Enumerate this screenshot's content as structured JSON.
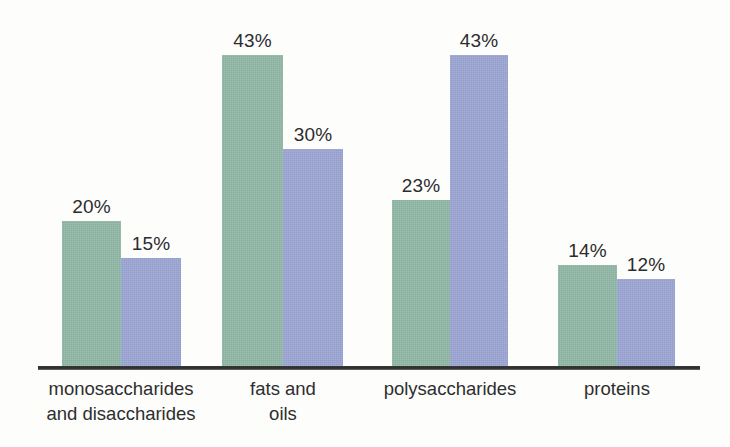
{
  "chart_data": {
    "type": "bar",
    "title": "",
    "subtitle": "",
    "xlabel": "",
    "ylabel": "",
    "ylim": [
      0,
      50
    ],
    "grid": false,
    "legend": "none",
    "value_suffix": "%",
    "categories": [
      "monosaccharides\nand disaccharides",
      "fats and\noils",
      "polysaccharides",
      "proteins"
    ],
    "series": [
      {
        "name": "green-series",
        "color": "#8fb7a4",
        "values": [
          20,
          43,
          23,
          14
        ],
        "labels": [
          "20%",
          "43%",
          "23%",
          "14%"
        ]
      },
      {
        "name": "blue-series",
        "color": "#9aa4d2",
        "values": [
          15,
          30,
          43,
          12
        ],
        "labels": [
          "15%",
          "30%",
          "43%",
          "12%"
        ]
      }
    ],
    "bars": [
      {
        "series": "green-series",
        "category": "monosaccharides and disaccharides",
        "value": 20,
        "label": "20%",
        "x": 62,
        "width": 59
      },
      {
        "series": "blue-series",
        "category": "monosaccharides and disaccharides",
        "value": 15,
        "label": "15%",
        "x": 121,
        "width": 60
      },
      {
        "series": "green-series",
        "category": "fats and oils",
        "value": 43,
        "label": "43%",
        "x": 222,
        "width": 61
      },
      {
        "series": "blue-series",
        "category": "fats and oils",
        "value": 30,
        "label": "30%",
        "x": 283,
        "width": 60
      },
      {
        "series": "green-series",
        "category": "polysaccharides",
        "value": 23,
        "label": "23%",
        "x": 392,
        "width": 58
      },
      {
        "series": "blue-series",
        "category": "polysaccharides",
        "value": 43,
        "label": "43%",
        "x": 450,
        "width": 58
      },
      {
        "series": "green-series",
        "category": "proteins",
        "value": 14,
        "label": "14%",
        "x": 558,
        "width": 59
      },
      {
        "series": "blue-series",
        "category": "proteins",
        "value": 12,
        "label": "12%",
        "x": 617,
        "width": 58
      }
    ],
    "category_positions": [
      {
        "label": "monosaccharides\nand disaccharides",
        "center": 121
      },
      {
        "label": "fats and\noils",
        "center": 283
      },
      {
        "label": "polysaccharides",
        "center": 450
      },
      {
        "label": "proteins",
        "center": 617
      }
    ],
    "axis": {
      "baseline_color": "#2b2b2b",
      "baseline_x_start": 38,
      "baseline_x_end": 700,
      "baseline_y": 366
    },
    "colors": {
      "green": "#8fb7a4",
      "blue": "#9aa4d2",
      "text": "#2c2c2c",
      "background": "#fdfdfc"
    }
  }
}
